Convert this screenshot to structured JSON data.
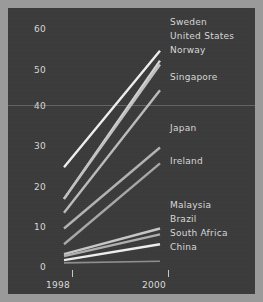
{
  "chart_data": {
    "type": "line",
    "title": "",
    "subtitle": "",
    "xlabel": "",
    "ylabel": "",
    "x": [
      1998,
      2000
    ],
    "xlim": [
      1997.6,
      2000.5
    ],
    "ylim": [
      -2,
      63
    ],
    "yticks": [
      0,
      10,
      20,
      30,
      40,
      50,
      60
    ],
    "ytick_labels": [
      "0",
      "10",
      "20",
      "30",
      "40",
      "50",
      "60"
    ],
    "xticks": [
      1998,
      2000
    ],
    "xtick_labels": [
      "1998",
      "2000"
    ],
    "grid": "single faint horizontal rule near y=40",
    "legend_position": "right, inline at series end",
    "series": [
      {
        "name": "Sweden",
        "values": [
          25.0,
          54.5
        ],
        "color": "#f0f0f0"
      },
      {
        "name": "United States",
        "values": [
          17.0,
          52.0
        ],
        "color": "#d6d6d6"
      },
      {
        "name": "Norway",
        "values": [
          17.0,
          51.0
        ],
        "color": "#c2c2c2"
      },
      {
        "name": "Singapore",
        "values": [
          13.5,
          44.5
        ],
        "color": "#bdbdbd"
      },
      {
        "name": "Japan",
        "values": [
          9.5,
          30.0
        ],
        "color": "#b4b4b4"
      },
      {
        "name": "Ireland",
        "values": [
          5.5,
          26.0
        ],
        "color": "#a8a8a8"
      },
      {
        "name": "Malaysia",
        "values": [
          3.0,
          9.5
        ],
        "color": "#c8c8c8"
      },
      {
        "name": "Brazil",
        "values": [
          2.5,
          8.0
        ],
        "color": "#b0b0b0"
      },
      {
        "name": "South Africa",
        "values": [
          1.5,
          5.5
        ],
        "color": "#efefef"
      },
      {
        "name": "China",
        "values": [
          0.8,
          1.2
        ],
        "color": "#8f8f8f"
      }
    ]
  },
  "axis": {
    "y_labels": [
      "60",
      "50",
      "40",
      "30",
      "20",
      "10",
      "0"
    ],
    "x_labels": [
      "1998",
      "2000"
    ]
  },
  "legend": {
    "items": [
      "Sweden",
      "United States",
      "Norway",
      "Singapore",
      "Japan",
      "Ireland",
      "Malaysia",
      "Brazil",
      "South Africa",
      "China"
    ]
  },
  "style": {
    "background": "#3b3b3b",
    "border": "#9a9a9a",
    "text": "#d9d9d9",
    "gridline": "#969696"
  }
}
